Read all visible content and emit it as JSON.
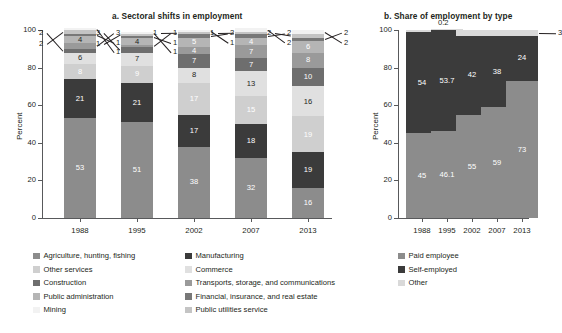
{
  "figure": {
    "panel_a_title": "a. Sectoral shifts in employment",
    "panel_b_title": "b. Share of employment by type",
    "y_axis_title_a": "Percent",
    "y_axis_title_b": "Percent"
  },
  "chart_data": [
    {
      "type": "bar",
      "id": "panel-a",
      "title": "a. Sectoral shifts in employment",
      "stacked": true,
      "xlabel": "",
      "ylabel": "Percent",
      "ylim": [
        0,
        100
      ],
      "yticks": [
        0,
        20,
        40,
        60,
        80,
        100
      ],
      "grid": false,
      "legend_position": "bottom-left",
      "categories": [
        "1988",
        "1995",
        "2002",
        "2007",
        "2013"
      ],
      "series": [
        {
          "name": "Agriculture, hunting, fishing",
          "color": "#8c8c8c",
          "values": [
            53,
            51,
            38,
            32,
            16
          ]
        },
        {
          "name": "Manufacturing",
          "color": "#3b3b3b",
          "values": [
            21,
            21,
            17,
            18,
            19
          ]
        },
        {
          "name": "Other services",
          "color": "#cfcfcf",
          "values": [
            8,
            9,
            17,
            15,
            19
          ]
        },
        {
          "name": "Commerce",
          "color": "#e0e0e0",
          "values": [
            6,
            7,
            8,
            13,
            16
          ]
        },
        {
          "name": "Construction",
          "color": "#6e6e6e",
          "values": [
            2,
            3,
            7,
            7,
            10
          ]
        },
        {
          "name": "Transports, storage, and communications",
          "color": "#9a9a9a",
          "values": [
            4,
            4,
            4,
            7,
            8
          ]
        },
        {
          "name": "Public administration",
          "color": "#b5b5b5",
          "values": [
            4,
            4,
            5,
            4,
            6
          ]
        },
        {
          "name": "Financial, insurance, and real estate",
          "color": "#787878",
          "values": [
            1,
            1,
            2,
            2,
            2
          ]
        },
        {
          "name": "Mining",
          "color": "#f2f2f2",
          "values": [
            1,
            1,
            1,
            1,
            1
          ]
        },
        {
          "name": "Public utilities service",
          "color": "#c4c4c4",
          "values": [
            2,
            1,
            1,
            2,
            2
          ]
        }
      ],
      "bars": [
        {
          "category": "1988",
          "segments": [
            {
              "label": "53",
              "value": 53,
              "color": "#8c8c8c",
              "text_color": "#ffffff",
              "inside": true
            },
            {
              "label": "21",
              "value": 21,
              "color": "#3b3b3b",
              "text_color": "#ffffff",
              "inside": true
            },
            {
              "label": "8",
              "value": 8,
              "color": "#cfcfcf",
              "text_color": "#ffffff",
              "inside": true
            },
            {
              "label": "6",
              "value": 6,
              "color": "#e0e0e0",
              "text_color": "#231f20",
              "inside": true
            },
            {
              "label": "2",
              "value": 2,
              "color": "#6e6e6e",
              "text_color": "#231f20",
              "inside": false,
              "side": "left"
            },
            {
              "label": "3",
              "value": 3,
              "color": "#9a9a9a",
              "text_color": "#231f20",
              "inside": false,
              "side": "right"
            },
            {
              "label": "4",
              "value": 4,
              "color": "#b5b5b5",
              "text_color": "#231f20",
              "inside": true
            },
            {
              "label": "1",
              "value": 1,
              "color": "#787878",
              "text_color": "#231f20",
              "inside": false,
              "side": "right"
            },
            {
              "label": "2",
              "value": 2,
              "color": "#c4c4c4",
              "text_color": "#231f20",
              "inside": false,
              "side": "left"
            },
            {
              "label": "1",
              "value": 1,
              "color": "#f2f2f2",
              "text_color": "#231f20",
              "inside": false,
              "side": "right"
            }
          ]
        },
        {
          "category": "1995",
          "segments": [
            {
              "label": "51",
              "value": 51,
              "color": "#8c8c8c",
              "text_color": "#ffffff",
              "inside": true
            },
            {
              "label": "21",
              "value": 21,
              "color": "#3b3b3b",
              "text_color": "#ffffff",
              "inside": true
            },
            {
              "label": "9",
              "value": 9,
              "color": "#cfcfcf",
              "text_color": "#ffffff",
              "inside": true
            },
            {
              "label": "7",
              "value": 7,
              "color": "#e0e0e0",
              "text_color": "#231f20",
              "inside": true
            },
            {
              "label": "3",
              "value": 3,
              "color": "#6e6e6e",
              "text_color": "#231f20",
              "inside": false,
              "side": "left"
            },
            {
              "label": "1",
              "value": 1,
              "color": "#9a9a9a",
              "text_color": "#231f20",
              "inside": false,
              "side": "right"
            },
            {
              "label": "4",
              "value": 4,
              "color": "#b5b5b5",
              "text_color": "#231f20",
              "inside": true
            },
            {
              "label": "1",
              "value": 1,
              "color": "#787878",
              "text_color": "#231f20",
              "inside": false,
              "side": "right"
            },
            {
              "label": "1",
              "value": 1,
              "color": "#c4c4c4",
              "text_color": "#231f20",
              "inside": false,
              "side": "left"
            },
            {
              "label": "1",
              "value": 1,
              "color": "#f2f2f2",
              "text_color": "#231f20",
              "inside": false,
              "side": "right"
            }
          ]
        },
        {
          "category": "2002",
          "segments": [
            {
              "label": "38",
              "value": 38,
              "color": "#8c8c8c",
              "text_color": "#ffffff",
              "inside": true
            },
            {
              "label": "17",
              "value": 17,
              "color": "#3b3b3b",
              "text_color": "#ffffff",
              "inside": true
            },
            {
              "label": "17",
              "value": 17,
              "color": "#cfcfcf",
              "text_color": "#ffffff",
              "inside": true
            },
            {
              "label": "8",
              "value": 8,
              "color": "#e0e0e0",
              "text_color": "#231f20",
              "inside": true
            },
            {
              "label": "7",
              "value": 7,
              "color": "#6e6e6e",
              "text_color": "#ffffff",
              "inside": true
            },
            {
              "label": "4",
              "value": 4,
              "color": "#9a9a9a",
              "text_color": "#ffffff",
              "inside": true
            },
            {
              "label": "5",
              "value": 5,
              "color": "#b5b5b5",
              "text_color": "#ffffff",
              "inside": true
            },
            {
              "label": "2",
              "value": 2,
              "color": "#787878",
              "text_color": "#231f20",
              "inside": false,
              "side": "right"
            },
            {
              "label": "1",
              "value": 1,
              "color": "#c4c4c4",
              "text_color": "#231f20",
              "inside": false,
              "side": "left"
            },
            {
              "label": "1",
              "value": 1,
              "color": "#f2f2f2",
              "text_color": "#231f20",
              "inside": false,
              "side": "right"
            }
          ]
        },
        {
          "category": "2007",
          "segments": [
            {
              "label": "32",
              "value": 32,
              "color": "#8c8c8c",
              "text_color": "#ffffff",
              "inside": true
            },
            {
              "label": "18",
              "value": 18,
              "color": "#3b3b3b",
              "text_color": "#ffffff",
              "inside": true
            },
            {
              "label": "15",
              "value": 15,
              "color": "#cfcfcf",
              "text_color": "#ffffff",
              "inside": true
            },
            {
              "label": "13",
              "value": 13,
              "color": "#e0e0e0",
              "text_color": "#231f20",
              "inside": true
            },
            {
              "label": "7",
              "value": 7,
              "color": "#6e6e6e",
              "text_color": "#ffffff",
              "inside": true
            },
            {
              "label": "7",
              "value": 7,
              "color": "#9a9a9a",
              "text_color": "#ffffff",
              "inside": true
            },
            {
              "label": "4",
              "value": 4,
              "color": "#b5b5b5",
              "text_color": "#ffffff",
              "inside": true
            },
            {
              "label": "2",
              "value": 2,
              "color": "#787878",
              "text_color": "#231f20",
              "inside": false,
              "side": "right"
            },
            {
              "label": "1",
              "value": 1,
              "color": "#c4c4c4",
              "text_color": "#231f20",
              "inside": false,
              "side": "left"
            },
            {
              "label": "2",
              "value": 2,
              "color": "#f2f2f2",
              "text_color": "#231f20",
              "inside": false,
              "side": "right"
            }
          ]
        },
        {
          "category": "2013",
          "segments": [
            {
              "label": "16",
              "value": 16,
              "color": "#8c8c8c",
              "text_color": "#ffffff",
              "inside": true
            },
            {
              "label": "19",
              "value": 19,
              "color": "#3b3b3b",
              "text_color": "#ffffff",
              "inside": true
            },
            {
              "label": "19",
              "value": 19,
              "color": "#cfcfcf",
              "text_color": "#ffffff",
              "inside": true
            },
            {
              "label": "16",
              "value": 16,
              "color": "#e0e0e0",
              "text_color": "#231f20",
              "inside": true
            },
            {
              "label": "10",
              "value": 10,
              "color": "#6e6e6e",
              "text_color": "#ffffff",
              "inside": true
            },
            {
              "label": "8",
              "value": 8,
              "color": "#9a9a9a",
              "text_color": "#ffffff",
              "inside": true
            },
            {
              "label": "6",
              "value": 6,
              "color": "#b5b5b5",
              "text_color": "#ffffff",
              "inside": true
            },
            {
              "label": "2",
              "value": 2,
              "color": "#787878",
              "text_color": "#231f20",
              "inside": false,
              "side": "right"
            },
            {
              "label": "2",
              "value": 2,
              "color": "#c4c4c4",
              "text_color": "#231f20",
              "inside": false,
              "side": "left"
            },
            {
              "label": "2",
              "value": 2,
              "color": "#f2f2f2",
              "text_color": "#231f20",
              "inside": false,
              "side": "right"
            }
          ]
        }
      ]
    },
    {
      "type": "bar",
      "id": "panel-b",
      "title": "b. Share of employment by type",
      "stacked": true,
      "xlabel": "",
      "ylabel": "Percent",
      "ylim": [
        0,
        100
      ],
      "yticks": [
        0,
        20,
        40,
        60,
        80,
        100
      ],
      "grid": false,
      "legend_position": "bottom-right",
      "categories": [
        "1988",
        "1995",
        "2002",
        "2007",
        "2013"
      ],
      "series": [
        {
          "name": "Paid employee",
          "color": "#8c8c8c",
          "values": [
            45,
            46.1,
            55,
            59,
            73
          ]
        },
        {
          "name": "Self-employed",
          "color": "#3b3b3b",
          "values": [
            54,
            53.7,
            42,
            38,
            24
          ]
        },
        {
          "name": "Other",
          "color": "#d9d9d9",
          "values": [
            1,
            0.2,
            3,
            3,
            3
          ]
        }
      ],
      "bars": [
        {
          "category": "1988",
          "segments": [
            {
              "label": "45",
              "value": 45,
              "color": "#8c8c8c",
              "text_color": "#ffffff",
              "inside": true
            },
            {
              "label": "54",
              "value": 54,
              "color": "#3b3b3b",
              "text_color": "#ffffff",
              "inside": true
            },
            {
              "label": "1",
              "value": 1,
              "color": "#d9d9d9",
              "text_color": "#231f20",
              "inside": false,
              "side": "right"
            }
          ]
        },
        {
          "category": "1995",
          "segments": [
            {
              "label": "46.1",
              "value": 46.1,
              "color": "#8c8c8c",
              "text_color": "#ffffff",
              "inside": true
            },
            {
              "label": "53.7",
              "value": 53.7,
              "color": "#3b3b3b",
              "text_color": "#ffffff",
              "inside": true
            },
            {
              "label": "0.2",
              "value": 0.2,
              "color": "#d9d9d9",
              "text_color": "#231f20",
              "inside": false,
              "side": "top"
            }
          ]
        },
        {
          "category": "2002",
          "segments": [
            {
              "label": "55",
              "value": 55,
              "color": "#8c8c8c",
              "text_color": "#ffffff",
              "inside": true
            },
            {
              "label": "42",
              "value": 42,
              "color": "#3b3b3b",
              "text_color": "#ffffff",
              "inside": true
            },
            {
              "label": "3",
              "value": 3,
              "color": "#d9d9d9",
              "text_color": "#231f20",
              "inside": false,
              "side": "right"
            }
          ]
        },
        {
          "category": "2007",
          "segments": [
            {
              "label": "59",
              "value": 59,
              "color": "#8c8c8c",
              "text_color": "#ffffff",
              "inside": true
            },
            {
              "label": "38",
              "value": 38,
              "color": "#3b3b3b",
              "text_color": "#ffffff",
              "inside": true
            },
            {
              "label": "3",
              "value": 3,
              "color": "#d9d9d9",
              "text_color": "#231f20",
              "inside": false,
              "side": "right"
            }
          ]
        },
        {
          "category": "2013",
          "segments": [
            {
              "label": "73",
              "value": 73,
              "color": "#8c8c8c",
              "text_color": "#ffffff",
              "inside": true
            },
            {
              "label": "24",
              "value": 24,
              "color": "#3b3b3b",
              "text_color": "#ffffff",
              "inside": true
            },
            {
              "label": "3",
              "value": 3,
              "color": "#d9d9d9",
              "text_color": "#231f20",
              "inside": false,
              "side": "right"
            }
          ]
        }
      ]
    }
  ],
  "legend_a": {
    "items": [
      {
        "label": "Agriculture, hunting, fishing",
        "color": "#8c8c8c"
      },
      {
        "label": "Manufacturing",
        "color": "#3b3b3b"
      },
      {
        "label": "Other services",
        "color": "#cfcfcf"
      },
      {
        "label": "Commerce",
        "color": "#e0e0e0"
      },
      {
        "label": "Construction",
        "color": "#6e6e6e"
      },
      {
        "label": "Transports, storage, and communications",
        "color": "#9a9a9a"
      },
      {
        "label": "Public administration",
        "color": "#b5b5b5"
      },
      {
        "label": "Financial, insurance, and real estate",
        "color": "#787878"
      },
      {
        "label": "Mining",
        "color": "#f2f2f2"
      },
      {
        "label": "Public utilities service",
        "color": "#c4c4c4"
      }
    ]
  },
  "legend_b": {
    "items": [
      {
        "label": "Paid employee",
        "color": "#8c8c8c"
      },
      {
        "label": "Self-employed",
        "color": "#3b3b3b"
      },
      {
        "label": "Other",
        "color": "#d9d9d9"
      }
    ]
  }
}
